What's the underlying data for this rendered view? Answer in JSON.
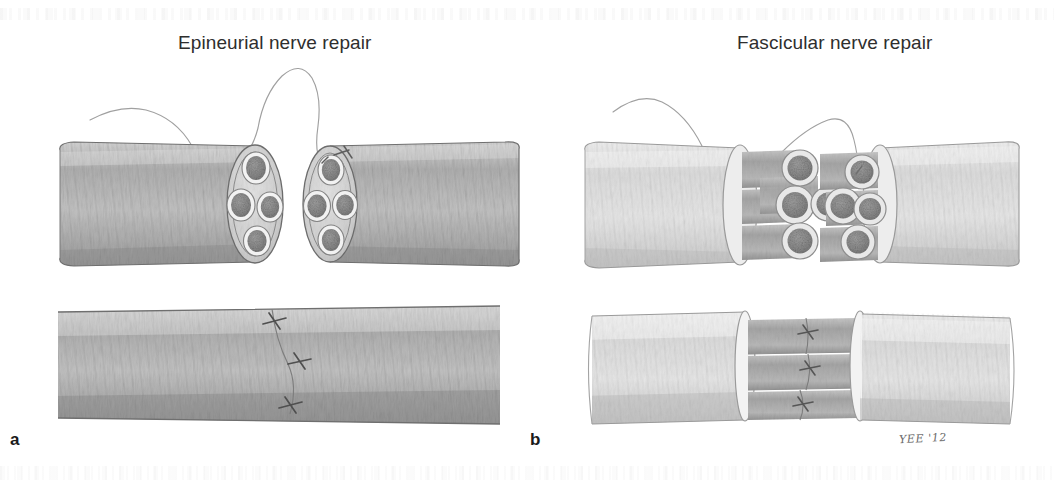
{
  "figure": {
    "caption_labels": {
      "panel_a": "a",
      "panel_b": "b"
    },
    "signature": "YEE '12"
  },
  "panels": [
    {
      "letter": "a",
      "title": "Epineurial nerve repair",
      "technique": "epineurial",
      "top_row": {
        "description": "Two transected nerve stumps facing each other with intact epineurium; suture thread passes between the two cut ends",
        "left_stump": {
          "fascicle_count": 4,
          "epineurium": "intact, dark grey striated"
        },
        "right_stump": {
          "fascicle_count": 4,
          "epineurium": "intact, dark grey striated"
        },
        "suture_threads": 1
      },
      "bottom_row": {
        "description": "Completed epineurial repair: single continuous nerve trunk with the epineurium sutured across the coaptation line",
        "suture_count": 3,
        "repair_line": "vertical, mid-shaft"
      }
    },
    {
      "letter": "b",
      "title": "Fascicular nerve repair",
      "technique": "fascicular",
      "top_row": {
        "description": "Two nerve stumps with epineurium retracted, exposing individual fascicles that protrude from each cut end; suture thread bridges the gap",
        "left_stump": {
          "fascicle_count": 4,
          "epineurium": "retracted, pale"
        },
        "right_stump": {
          "fascicle_count": 4,
          "epineurium": "retracted, pale"
        },
        "suture_threads": 1
      },
      "bottom_row": {
        "description": "Completed fascicular repair: three individual fascicle bundles each separately sutured between the two pale epineurial sleeves",
        "fascicle_bundles": 3,
        "suture_count": 3
      }
    }
  ],
  "colors": {
    "background": "#ffffff",
    "title_text": "#2e2e2e",
    "label_text": "#1a1a1a",
    "signature_text": "#6a6a6a",
    "epineurium_dark": "#a9a9a9",
    "epineurium_light": "#d8d8d8",
    "fascicle_core": "#8e8e8e",
    "fascicle_ring": "#efefef",
    "outline": "#7a7a7a",
    "suture_thread": "#9a9a9a"
  }
}
